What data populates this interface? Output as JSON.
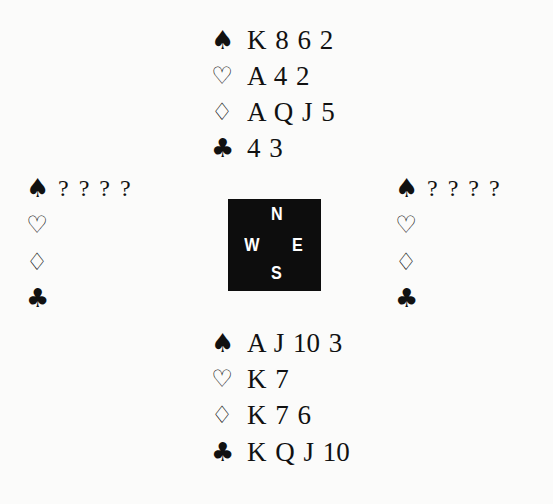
{
  "diagram": {
    "type": "bridge-deal",
    "compass": {
      "north": "N",
      "west": "W",
      "east": "E",
      "south": "S"
    },
    "suit_symbols": {
      "spades": "♠",
      "hearts": "♡",
      "diamonds": "♢",
      "clubs": "♣"
    },
    "hands": {
      "north": {
        "spades": "K 8 6 2",
        "hearts": "A 4 2",
        "diamonds": "A Q J 5",
        "clubs": "4 3"
      },
      "west": {
        "spades": "? ? ? ?",
        "hearts": "",
        "diamonds": "",
        "clubs": ""
      },
      "east": {
        "spades": "? ? ? ?",
        "hearts": "",
        "diamonds": "",
        "clubs": ""
      },
      "south": {
        "spades": "A J 10 3",
        "hearts": "K 7",
        "diamonds": "K 7 6",
        "clubs": "K Q J 10"
      }
    }
  }
}
